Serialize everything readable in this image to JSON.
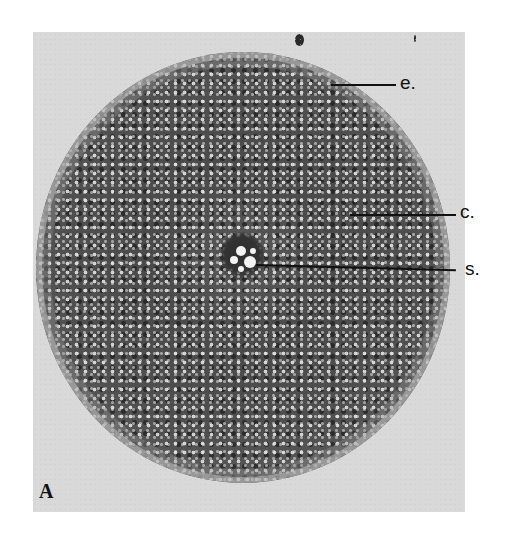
{
  "figure": {
    "panel_label": "A",
    "labels": [
      {
        "key": "e",
        "text": "e."
      },
      {
        "key": "c",
        "text": "c."
      },
      {
        "key": "s",
        "text": "s."
      }
    ]
  }
}
